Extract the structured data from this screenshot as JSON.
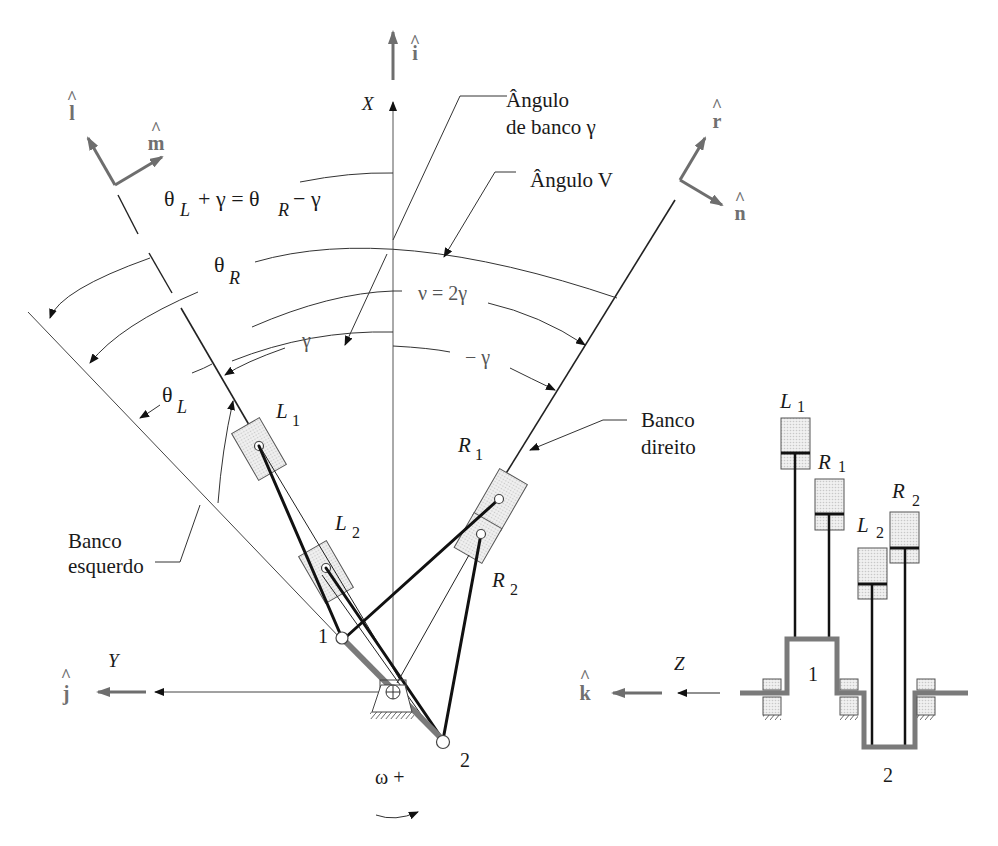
{
  "figure": {
    "language": "Portuguese"
  },
  "unit_vectors": {
    "i": "i",
    "j": "j",
    "k": "k",
    "l": "l",
    "m": "m",
    "n": "n",
    "r": "r"
  },
  "axes": {
    "x": "X",
    "y": "Y",
    "z": "Z"
  },
  "annotations": {
    "bank_angle_line1": "Ângulo",
    "bank_angle_line2": "de banco γ",
    "v_angle": "Ângulo V",
    "equation_theta": "θ",
    "equation_L": "L",
    "equation_plus_gamma": "+ γ  =  θ",
    "equation_R": "R",
    "equation_minus_gamma": "− γ",
    "theta_R_theta": "θ",
    "theta_R_sub": "R",
    "nu_eq": "ν = 2γ",
    "gamma": "γ",
    "minus_gamma": "− γ",
    "theta_L_theta": "θ",
    "theta_L_sub": "L",
    "right_bank_line1": "Banco",
    "right_bank_line2": "direito",
    "left_bank_line1": "Banco",
    "left_bank_line2": "esquerdo",
    "omega": "ω +"
  },
  "cylinders": {
    "L1_letter": "L",
    "L1_sub": "1",
    "L2_letter": "L",
    "L2_sub": "2",
    "R1_letter": "R",
    "R1_sub": "1",
    "R2_letter": "R",
    "R2_sub": "2"
  },
  "crank_pins": {
    "pin1": "1",
    "pin2": "2"
  },
  "side_view": {
    "L1_letter": "L",
    "L1_sub": "1",
    "R1_letter": "R",
    "R1_sub": "1",
    "L2_letter": "L",
    "L2_sub": "2",
    "R2_letter": "R",
    "R2_sub": "2",
    "throw1": "1",
    "throw2": "2"
  },
  "colors": {
    "line": "#222222",
    "unit_vector": "#6e6e6e",
    "crank": "#7a7a7a",
    "cylinder_fill": "#e2e2e2"
  }
}
